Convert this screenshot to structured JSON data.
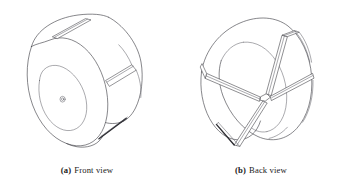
{
  "figure": {
    "background_color": "#ffffff",
    "line_color": "#3c3c42",
    "subfigures": [
      {
        "id": "a",
        "tag": "(a)",
        "caption": "Front view",
        "object": "slotted cylindrical rotor, isometric projection, solid front face",
        "features": [
          "outer cylindrical rim",
          "circular front face",
          "raised central boss",
          "small center hole",
          "narrow slot on top surface",
          "narrow slot on right cylindrical surface",
          "narrow slot on lower-right cylindrical surface"
        ]
      },
      {
        "id": "b",
        "tag": "(b)",
        "caption": "Back view",
        "object": "slotted cylindrical rotor, isometric projection, open back with radial vanes",
        "features": [
          "outer cylindrical rim",
          "open hollow interior",
          "radial vane upper right",
          "radial vane left",
          "radial vane lower",
          "central hub junction",
          "through slots in rim"
        ]
      }
    ]
  }
}
